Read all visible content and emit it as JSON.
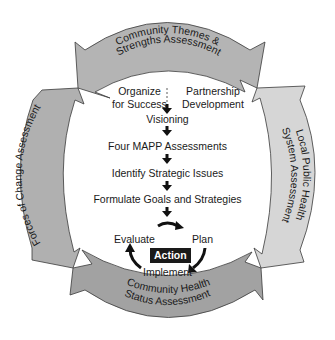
{
  "colors": {
    "top_band": "#b4b4b4",
    "right_band": "#d6d6d6",
    "bottom_band": "#a2a2a2",
    "left_band": "#b0b0b0",
    "text": "#1a1a1a",
    "action_bg": "#1a1a1a",
    "action_text": "#ffffff"
  },
  "bands": {
    "top": {
      "line1": "Community Themes &",
      "line2": "Strengths Assessment"
    },
    "right": {
      "line1": "Local Public Health",
      "line2": "System Assessment"
    },
    "bottom": {
      "line1": "Community Health",
      "line2": "Status Assessment"
    },
    "left": {
      "line1": "Forces of Change Assessment"
    }
  },
  "steps": {
    "organize_line1": "Organize",
    "organize_line2": "for Success",
    "partnership_line1": "Partnership",
    "partnership_line2": "Development",
    "visioning": "Visioning",
    "four_mapp": "Four MAPP Assessments",
    "identify": "Identify Strategic Issues",
    "formulate": "Formulate Goals and Strategies"
  },
  "cycle": {
    "evaluate": "Evaluate",
    "plan": "Plan",
    "action": "Action",
    "implement": "Implement"
  }
}
